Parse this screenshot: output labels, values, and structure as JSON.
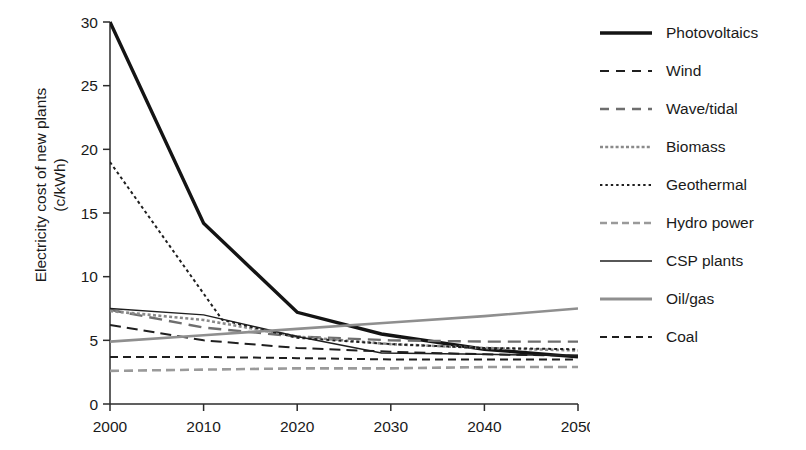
{
  "chart_data": {
    "type": "line",
    "title": "",
    "xlabel": "",
    "ylabel": "Electricity cost of new plants (c/kWh)",
    "ylabel_line1": "Electricity cost of new plants",
    "ylabel_line2": "(c/kWh)",
    "xlim": [
      2000,
      2050
    ],
    "ylim": [
      0,
      30
    ],
    "xticks": [
      2000,
      2010,
      2020,
      2030,
      2040,
      2050
    ],
    "yticks": [
      0,
      5,
      10,
      15,
      20,
      25,
      30
    ],
    "xtick_labels": [
      "2000",
      "2010",
      "2020",
      "2030",
      "2040",
      "2050"
    ],
    "ytick_labels": [
      "0",
      "5",
      "10",
      "15",
      "20",
      "25",
      "30"
    ],
    "grid": false,
    "legend_position": "right",
    "series": [
      {
        "name": "Photovoltaics",
        "style": "solid",
        "color": "#141414",
        "width": 3.4,
        "dash": "none",
        "x": [
          2000,
          2010,
          2020,
          2029,
          2040,
          2050
        ],
        "values": [
          30.0,
          14.2,
          7.2,
          5.5,
          4.3,
          3.7
        ]
      },
      {
        "name": "Wind",
        "style": "long-dash",
        "color": "#1f1f1f",
        "width": 2.0,
        "dash": "11,6",
        "x": [
          2000,
          2010,
          2020,
          2030,
          2040,
          2050
        ],
        "values": [
          6.2,
          5.0,
          4.4,
          4.1,
          3.9,
          3.8
        ]
      },
      {
        "name": "Wave/tidal",
        "style": "long-dash",
        "color": "#6e6e6e",
        "width": 2.4,
        "dash": "13,7",
        "x": [
          2000,
          2010,
          2020,
          2030,
          2040,
          2050
        ],
        "values": [
          7.4,
          6.0,
          5.3,
          5.0,
          4.9,
          4.9
        ]
      },
      {
        "name": "Biomass",
        "style": "dotted-fine",
        "color": "#8a8a8a",
        "width": 2.6,
        "dash": "3,2.4",
        "x": [
          2000,
          2010,
          2020,
          2030,
          2040,
          2050
        ],
        "values": [
          7.3,
          6.6,
          5.3,
          4.7,
          4.4,
          4.2
        ]
      },
      {
        "name": "Geothermal",
        "style": "dotted",
        "color": "#1f1f1f",
        "width": 2.0,
        "dash": "3,3",
        "x": [
          2000,
          2012,
          2020,
          2030,
          2040,
          2050
        ],
        "values": [
          19.0,
          6.6,
          5.2,
          4.7,
          4.4,
          4.3
        ]
      },
      {
        "name": "Hydro power",
        "style": "dash",
        "color": "#9a9a9a",
        "width": 2.6,
        "dash": "9,5",
        "x": [
          2000,
          2010,
          2020,
          2030,
          2040,
          2050
        ],
        "values": [
          2.6,
          2.7,
          2.8,
          2.8,
          2.9,
          2.9
        ]
      },
      {
        "name": "CSP plants",
        "style": "solid",
        "color": "#1f1f1f",
        "width": 1.5,
        "dash": "none",
        "x": [
          2000,
          2010,
          2020,
          2029,
          2040,
          2050
        ],
        "values": [
          7.5,
          7.0,
          5.3,
          4.0,
          3.9,
          3.8
        ]
      },
      {
        "name": "Oil/gas",
        "style": "solid",
        "color": "#8f8f8f",
        "width": 2.6,
        "dash": "none",
        "x": [
          2000,
          2010,
          2020,
          2030,
          2040,
          2050
        ],
        "values": [
          4.9,
          5.4,
          5.9,
          6.4,
          6.9,
          7.5
        ]
      },
      {
        "name": "Coal",
        "style": "dash",
        "color": "#1f1f1f",
        "width": 2.0,
        "dash": "8,5",
        "x": [
          2000,
          2010,
          2020,
          2030,
          2040,
          2050
        ],
        "values": [
          3.7,
          3.7,
          3.6,
          3.5,
          3.5,
          3.5
        ]
      }
    ]
  },
  "legend": {
    "items": [
      {
        "label": "Photovoltaics",
        "swatch": "thick-solid-black"
      },
      {
        "label": "Wind",
        "swatch": "long-dash-black"
      },
      {
        "label": "Wave/tidal",
        "swatch": "long-dash-gray"
      },
      {
        "label": "Biomass",
        "swatch": "fine-dotted-gray"
      },
      {
        "label": "Geothermal",
        "swatch": "dotted-black"
      },
      {
        "label": "Hydro power",
        "swatch": "dash-gray"
      },
      {
        "label": "CSP plants",
        "swatch": "thin-solid-black"
      },
      {
        "label": "Oil/gas",
        "swatch": "solid-gray"
      },
      {
        "label": "Coal",
        "swatch": "dash-black"
      }
    ]
  }
}
